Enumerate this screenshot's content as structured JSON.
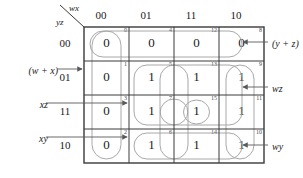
{
  "diagram": {
    "type": "karnaugh-map",
    "variables": 4,
    "column_variable_label": "wx",
    "row_variable_label": "yz",
    "column_headers": [
      "00",
      "01",
      "11",
      "10"
    ],
    "row_headers": [
      "00",
      "01",
      "11",
      "10"
    ],
    "cells": [
      {
        "index": "0",
        "value": "0",
        "row": 0,
        "col": 0
      },
      {
        "index": "4",
        "value": "0",
        "row": 0,
        "col": 1
      },
      {
        "index": "12",
        "value": "0",
        "row": 0,
        "col": 2
      },
      {
        "index": "8",
        "value": "0",
        "row": 0,
        "col": 3
      },
      {
        "index": "1",
        "value": "0",
        "row": 1,
        "col": 0
      },
      {
        "index": "5",
        "value": "1",
        "row": 1,
        "col": 1
      },
      {
        "index": "13",
        "value": "1",
        "row": 1,
        "col": 2
      },
      {
        "index": "9",
        "value": "1",
        "row": 1,
        "col": 3
      },
      {
        "index": "3",
        "value": "0",
        "row": 2,
        "col": 0
      },
      {
        "index": "7",
        "value": "1",
        "row": 2,
        "col": 1
      },
      {
        "index": "15",
        "value": "1",
        "row": 2,
        "col": 2
      },
      {
        "index": "11",
        "value": "1",
        "row": 2,
        "col": 3
      },
      {
        "index": "2",
        "value": "0",
        "row": 3,
        "col": 0
      },
      {
        "index": "6",
        "value": "1",
        "row": 3,
        "col": 1
      },
      {
        "index": "14",
        "value": "1",
        "row": 3,
        "col": 2
      },
      {
        "index": "10",
        "value": "1",
        "row": 3,
        "col": 3
      }
    ],
    "groups": [
      {
        "id": "g-yz",
        "label": "(y + z)",
        "side": "right",
        "cells": [
          "0",
          "4",
          "12",
          "8"
        ]
      },
      {
        "id": "g-wx",
        "label": "(w + x)",
        "side": "left",
        "cells": [
          "0",
          "1",
          "3",
          "2"
        ]
      },
      {
        "id": "g-wz",
        "label": "wz",
        "side": "right",
        "cells": [
          "5",
          "13",
          "9",
          "7",
          "15",
          "11"
        ]
      },
      {
        "id": "g-wy",
        "label": "wy",
        "side": "right",
        "cells": [
          "9",
          "11",
          "10",
          "13",
          "15",
          "14"
        ]
      },
      {
        "id": "g-xz",
        "label": "xz",
        "side": "left",
        "cells": [
          "5",
          "13",
          "7",
          "15"
        ]
      },
      {
        "id": "g-xy",
        "label": "xy",
        "side": "left",
        "cells": [
          "6",
          "14",
          "7",
          "15"
        ]
      }
    ],
    "annotations": {
      "yz_sum": "(y + z)",
      "wx_sum": "(w + x)",
      "wz_prod": "wz",
      "wy_prod": "wy",
      "xz_prod": "xz",
      "xy_prod": "xy"
    },
    "colors": {
      "grid_line": "#3a3a3a",
      "group_outline": "#9a9a9a",
      "arrow": "#5a5a5a",
      "text": "#1a1a1a",
      "index_text": "#4a4a4a",
      "background": "#ffffff"
    }
  }
}
